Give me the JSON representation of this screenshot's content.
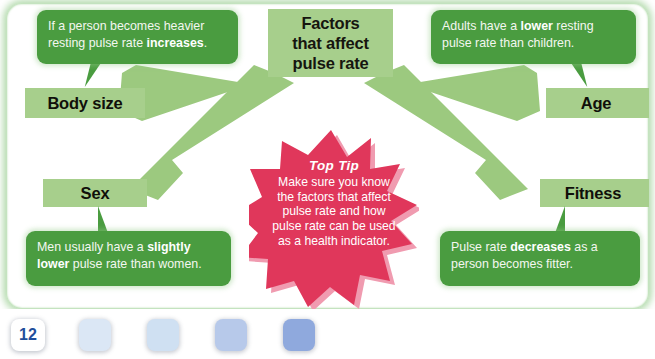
{
  "diagram": {
    "center": {
      "title_lines": [
        "Factors",
        "that affect",
        "pulse rate"
      ],
      "title": "Factors that affect pulse rate",
      "box_color": "#a7cf8c"
    },
    "factors": [
      {
        "id": "body-size",
        "label": "Body size"
      },
      {
        "id": "age",
        "label": "Age"
      },
      {
        "id": "sex",
        "label": "Sex"
      },
      {
        "id": "fitness",
        "label": "Fitness"
      }
    ],
    "bubbles": [
      {
        "id": "body-size-bubble",
        "pre": "If a person becomes heavier resting pulse rate ",
        "bold": "increases",
        "post": ".",
        "full": "If a person becomes heavier resting pulse rate increases."
      },
      {
        "id": "age-bubble",
        "pre": "Adults have a ",
        "bold": "lower",
        "post": " resting pulse rate than children.",
        "full": "Adults have a lower resting pulse rate than children."
      },
      {
        "id": "sex-bubble",
        "pre": "Men usually have a ",
        "bold": "slightly lower",
        "post": " pulse rate than women.",
        "full": "Men usually have a slightly lower pulse rate than women."
      },
      {
        "id": "fitness-bubble",
        "pre": "Pulse rate ",
        "bold": "decreases",
        "post": " as a person becomes fitter.",
        "full": "Pulse rate decreases as a person becomes fitter."
      }
    ],
    "top_tip": {
      "title": "Top Tip",
      "body": "Make sure you know the factors that affect pulse rate and how pulse rate can be used as a health indicator.",
      "star_color": "#e0375b",
      "star_shadow_color": "#f09bb0"
    },
    "arrow_color": "#9cc97f",
    "bubble_color": "#4a9c40"
  },
  "footer": {
    "page_number": "12",
    "page_number_color": "#1f4e9c",
    "swatches": [
      {
        "id": "swatch-1",
        "color": "#dbe7f5"
      },
      {
        "id": "swatch-2",
        "color": "#cfe0f2"
      },
      {
        "id": "swatch-3",
        "color": "#b7c9ea"
      },
      {
        "id": "swatch-4",
        "color": "#8fa9dd"
      }
    ]
  }
}
